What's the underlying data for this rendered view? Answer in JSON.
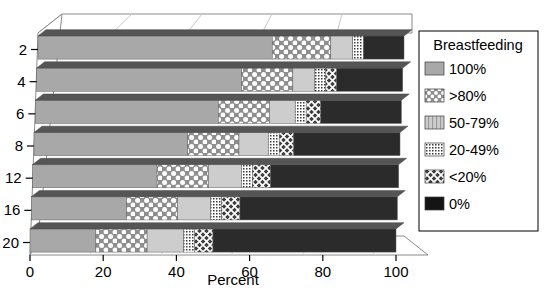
{
  "chart_data": {
    "type": "bar",
    "orientation": "horizontal",
    "stacked": true,
    "style": "3d",
    "title": "",
    "xlabel": "Percent",
    "ylabel": "",
    "xlim": [
      0,
      100
    ],
    "xticks": [
      0,
      20,
      40,
      60,
      80,
      100
    ],
    "xticklabels": [
      "0",
      "20",
      "40",
      "60",
      "80",
      "100"
    ],
    "grid": false,
    "categories": [
      "2",
      "4",
      "6",
      "8",
      "12",
      "16",
      "20"
    ],
    "legend": {
      "title": "Breastfeeding",
      "position": "right",
      "entries": [
        "100%",
        ">80%",
        "50-79%",
        "20-49%",
        "<20%",
        "0%"
      ]
    },
    "series": [
      {
        "name": "100%",
        "pattern": "solid-gray",
        "color": "#a8a8a8",
        "values": [
          64,
          56,
          50,
          42,
          34,
          26,
          18
        ]
      },
      {
        "name": ">80%",
        "pattern": "dots-large",
        "color": "#bdbdbd",
        "values": [
          16,
          14,
          14,
          14,
          14,
          14,
          14
        ]
      },
      {
        "name": "50-79%",
        "pattern": "solid-light",
        "color": "#cfcfcf",
        "values": [
          6,
          6,
          7,
          8,
          9,
          9,
          10
        ]
      },
      {
        "name": "20-49%",
        "pattern": "dots-fine",
        "color": "#d6d6d6",
        "values": [
          3,
          3,
          3,
          3,
          3,
          3,
          3
        ]
      },
      {
        "name": "<20%",
        "pattern": "crosshatch-dark",
        "color": "#5a5a5a",
        "values": [
          0,
          3,
          4,
          4,
          5,
          5,
          5
        ]
      },
      {
        "name": "0%",
        "pattern": "solid-black",
        "color": "#2b2b2b",
        "values": [
          11,
          18,
          22,
          29,
          35,
          43,
          50
        ]
      }
    ]
  },
  "axis": {
    "y_ticklabels": [
      "2",
      "4",
      "6",
      "8",
      "12",
      "16",
      "20"
    ],
    "x_ticklabels": [
      "0",
      "20",
      "40",
      "60",
      "80",
      "100"
    ],
    "x_title": "Percent"
  },
  "legend": {
    "title": "Breastfeeding",
    "items": [
      {
        "label": "100%",
        "swatch": "swatch-solid-gray"
      },
      {
        "label": ">80%",
        "swatch": "swatch-dots-large"
      },
      {
        "label": "50-79%",
        "swatch": "swatch-solid-light"
      },
      {
        "label": "20-49%",
        "swatch": "swatch-dots-fine"
      },
      {
        "label": "<20%",
        "swatch": "swatch-crosshatch"
      },
      {
        "label": "0%",
        "swatch": "swatch-black"
      }
    ]
  },
  "colors": {
    "bar_100": "#a8a8a8",
    "bar_80": "#bdbdbd",
    "bar_50_79": "#cfcfcf",
    "bar_20_49": "#d6d6d6",
    "bar_lt20": "#5a5a5a",
    "bar_0": "#2b2b2b",
    "axis": "#000000",
    "floor": "#ffffff",
    "background": "#ffffff"
  }
}
